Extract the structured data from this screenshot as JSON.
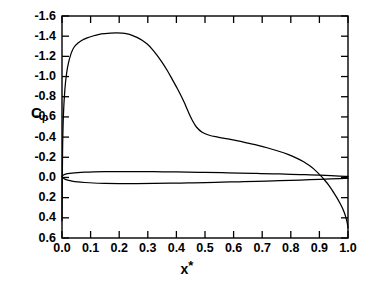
{
  "chart_data": {
    "type": "line",
    "title": "",
    "xlabel": "x*",
    "ylabel": "Cp",
    "ylabel_base": "C",
    "ylabel_sub": "p",
    "xlim": [
      0.0,
      1.0
    ],
    "ylim": [
      0.6,
      -1.6
    ],
    "y_inverted": true,
    "grid": false,
    "legend": "none",
    "xticks": [
      "0.0",
      "0.1",
      "0.2",
      "0.3",
      "0.4",
      "0.5",
      "0.6",
      "0.7",
      "0.8",
      "0.9",
      "1.0"
    ],
    "xtick_values": [
      0.0,
      0.1,
      0.2,
      0.3,
      0.4,
      0.5,
      0.6,
      0.7,
      0.8,
      0.9,
      1.0
    ],
    "yticks": [
      "-1.6",
      "-1.4",
      "-1.2",
      "-1.0",
      "-0.8",
      "-0.6",
      "-0.4",
      "-0.2",
      "0.0",
      "0.2",
      "0.4",
      "0.6"
    ],
    "ytick_values": [
      -1.6,
      -1.4,
      -1.2,
      -1.0,
      -0.8,
      -0.6,
      -0.4,
      -0.2,
      0.0,
      0.2,
      0.4,
      0.6
    ],
    "series": [
      {
        "name": "upper-surface-pressure-coefficient",
        "color": "#000000",
        "x": [
          0.0,
          0.002,
          0.005,
          0.01,
          0.016,
          0.023,
          0.032,
          0.042,
          0.055,
          0.07,
          0.088,
          0.108,
          0.13,
          0.15,
          0.17,
          0.19,
          0.21,
          0.228,
          0.245,
          0.262,
          0.28,
          0.298,
          0.315,
          0.332,
          0.35,
          0.368,
          0.385,
          0.4,
          0.415,
          0.428,
          0.44,
          0.455,
          0.47,
          0.49,
          0.515,
          0.545,
          0.58,
          0.615,
          0.65,
          0.685,
          0.72,
          0.755,
          0.79,
          0.82,
          0.845,
          0.865,
          0.88,
          0.9,
          0.918,
          0.935,
          0.95,
          0.962,
          0.972,
          0.98,
          0.987,
          0.992,
          0.996,
          0.999,
          1.0
        ],
        "y": [
          0.43,
          -0.26,
          -0.62,
          -0.87,
          -1.03,
          -1.14,
          -1.23,
          -1.29,
          -1.33,
          -1.36,
          -1.383,
          -1.402,
          -1.418,
          -1.426,
          -1.431,
          -1.433,
          -1.43,
          -1.422,
          -1.408,
          -1.388,
          -1.36,
          -1.322,
          -1.272,
          -1.212,
          -1.14,
          -1.06,
          -0.975,
          -0.898,
          -0.818,
          -0.74,
          -0.66,
          -0.57,
          -0.5,
          -0.448,
          -0.418,
          -0.4,
          -0.382,
          -0.362,
          -0.34,
          -0.318,
          -0.292,
          -0.262,
          -0.228,
          -0.192,
          -0.155,
          -0.118,
          -0.085,
          -0.03,
          0.025,
          0.085,
          0.15,
          0.205,
          0.255,
          0.3,
          0.348,
          0.39,
          0.432,
          0.478,
          0.5
        ]
      },
      {
        "name": "airfoil-section-upper-outline",
        "color": "#000000",
        "x": [
          0.0,
          0.004,
          0.01,
          0.02,
          0.035,
          0.055,
          0.08,
          0.11,
          0.15,
          0.2,
          0.26,
          0.32,
          0.38,
          0.44,
          0.5,
          0.56,
          0.62,
          0.68,
          0.74,
          0.8,
          0.85,
          0.9,
          0.94,
          0.97,
          0.99,
          1.0
        ],
        "y": [
          -0.01,
          -0.022,
          -0.03,
          -0.037,
          -0.043,
          -0.048,
          -0.052,
          -0.055,
          -0.057,
          -0.058,
          -0.058,
          -0.057,
          -0.055,
          -0.053,
          -0.05,
          -0.047,
          -0.044,
          -0.04,
          -0.036,
          -0.031,
          -0.027,
          -0.022,
          -0.017,
          -0.013,
          -0.011,
          -0.01
        ]
      },
      {
        "name": "airfoil-section-lower-outline",
        "color": "#000000",
        "x": [
          0.0,
          0.004,
          0.01,
          0.02,
          0.035,
          0.055,
          0.08,
          0.11,
          0.15,
          0.2,
          0.26,
          0.32,
          0.38,
          0.44,
          0.5,
          0.56,
          0.62,
          0.68,
          0.74,
          0.8,
          0.85,
          0.9,
          0.94,
          0.97,
          0.99,
          1.0
        ],
        "y": [
          -0.01,
          0.006,
          0.016,
          0.026,
          0.036,
          0.044,
          0.05,
          0.055,
          0.058,
          0.06,
          0.06,
          0.059,
          0.057,
          0.054,
          0.051,
          0.047,
          0.043,
          0.039,
          0.034,
          0.029,
          0.024,
          0.019,
          0.015,
          0.012,
          0.01,
          0.009
        ]
      }
    ],
    "annotations": {
      "peak_cp": -1.433,
      "peak_x": 0.19,
      "shoulder_x": 0.44,
      "shoulder_cp": -0.42,
      "zero_crossing_x": 0.905,
      "trailing_edge_cp": 0.5
    }
  }
}
